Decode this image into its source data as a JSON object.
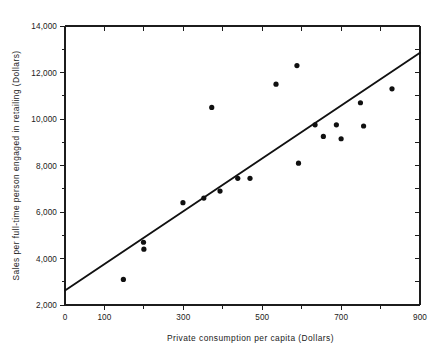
{
  "chart_data": {
    "type": "scatter",
    "title": "",
    "subtitle": "",
    "xlabel": "Private consumption per capita (Dollars)",
    "ylabel": "Sales per full-time person engaged in retailing (Dollars)",
    "xlim": [
      0,
      900
    ],
    "ylim": [
      2000,
      14000
    ],
    "grid": false,
    "legend": null,
    "x_major_ticks": [
      0,
      100,
      300,
      500,
      700,
      900
    ],
    "x_tick_labels": [
      "0",
      "100",
      "300",
      "500",
      "700",
      "900"
    ],
    "x_minor_ticks": [
      200,
      400,
      600,
      800
    ],
    "x_top_ticks": [
      100,
      200,
      300,
      400,
      500,
      600,
      700,
      800
    ],
    "y_major_ticks": [
      2000,
      4000,
      6000,
      8000,
      10000,
      12000,
      14000
    ],
    "y_tick_labels": [
      "2,000",
      "4,000",
      "6,000",
      "8,000",
      "10,000",
      "12,000",
      "14,000"
    ],
    "y_minor_ticks": [
      3000,
      5000,
      7000,
      9000,
      11000,
      13000
    ],
    "y_right_ticks": [
      3000,
      4000,
      5000,
      6000,
      7000,
      8000,
      9000,
      10000,
      11000,
      12000,
      13000
    ],
    "point_radius_px": 2.6,
    "marker": "filled-circle",
    "marker_color": "#101010",
    "line_color": "#111111",
    "axis_color": "#1c1c1c",
    "x": [
      148,
      199,
      200,
      299,
      352,
      372,
      393,
      438,
      469,
      535,
      588,
      592,
      634,
      655,
      688,
      700,
      749,
      757,
      829
    ],
    "y": [
      3100,
      4700,
      4400,
      6400,
      6600,
      10500,
      6900,
      7450,
      7450,
      11500,
      12300,
      8100,
      9750,
      9250,
      9750,
      9150,
      10700,
      9700,
      11300
    ],
    "points": [
      {
        "x": 148,
        "y": 3100
      },
      {
        "x": 199,
        "y": 4700
      },
      {
        "x": 200,
        "y": 4400
      },
      {
        "x": 299,
        "y": 6400
      },
      {
        "x": 352,
        "y": 6600
      },
      {
        "x": 372,
        "y": 10500
      },
      {
        "x": 393,
        "y": 6900
      },
      {
        "x": 438,
        "y": 7450
      },
      {
        "x": 469,
        "y": 7450
      },
      {
        "x": 535,
        "y": 11500
      },
      {
        "x": 588,
        "y": 12300
      },
      {
        "x": 592,
        "y": 8100
      },
      {
        "x": 634,
        "y": 9750
      },
      {
        "x": 655,
        "y": 9250
      },
      {
        "x": 688,
        "y": 9750
      },
      {
        "x": 700,
        "y": 9150
      },
      {
        "x": 749,
        "y": 10700
      },
      {
        "x": 757,
        "y": 9700
      },
      {
        "x": 829,
        "y": 11300
      }
    ],
    "fit_line": {
      "name": "regression line",
      "x0": 0,
      "y0": 2620,
      "x1": 900,
      "y1": 12850
    }
  }
}
